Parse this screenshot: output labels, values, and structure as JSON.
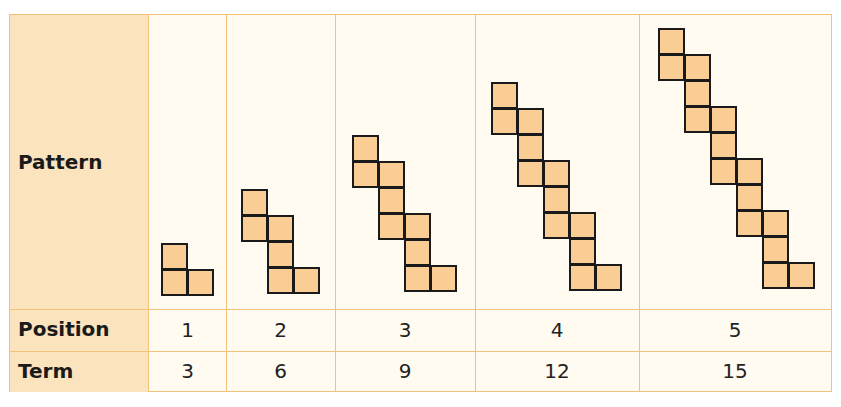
{
  "table": {
    "row_headers": {
      "pattern": "Pattern",
      "position": "Position",
      "term": "Term"
    },
    "columns": [
      {
        "position": "1",
        "term": "3",
        "squares": 3
      },
      {
        "position": "2",
        "term": "6",
        "squares": 6
      },
      {
        "position": "3",
        "term": "9",
        "squares": 9
      },
      {
        "position": "4",
        "term": "12",
        "squares": 12
      },
      {
        "position": "5",
        "term": "15",
        "squares": 15
      }
    ]
  },
  "colors": {
    "header_fill": "#fbe3bd",
    "cell_fill": "#fffbf0",
    "grid_line": "#f2c27a",
    "square_fill": "#f9cd94",
    "square_border": "#1a1a1a"
  }
}
